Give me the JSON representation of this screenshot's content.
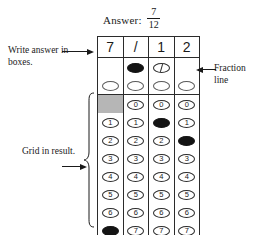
{
  "heading": {
    "answer_label": "Answer:",
    "fraction_numerator": "7",
    "fraction_denominator": "12"
  },
  "annotations": {
    "write_in_boxes": "Write answer in boxes.",
    "fraction_line": "Fraction line",
    "grid_in_result": "Grid in result."
  },
  "grid": {
    "columns": 4,
    "answer_boxes": [
      "7",
      "/",
      "1",
      "2"
    ],
    "fraction_line_row": {
      "label": "fraction-line-bubbles",
      "cells": [
        "none",
        "filled",
        "slashed",
        "none"
      ]
    },
    "decimal_point_row": {
      "label": "decimal-point-bubbles",
      "cells": [
        "empty",
        "empty",
        "empty",
        "empty"
      ]
    },
    "digit_rows": [
      {
        "digit": "0",
        "cells": [
          "shaded-blank",
          "empty",
          "empty",
          "empty"
        ]
      },
      {
        "digit": "1",
        "cells": [
          "empty",
          "empty",
          "filled",
          "empty"
        ]
      },
      {
        "digit": "2",
        "cells": [
          "empty",
          "empty",
          "empty",
          "filled"
        ]
      },
      {
        "digit": "3",
        "cells": [
          "empty",
          "empty",
          "empty",
          "empty"
        ]
      },
      {
        "digit": "4",
        "cells": [
          "empty",
          "empty",
          "empty",
          "empty"
        ]
      },
      {
        "digit": "5",
        "cells": [
          "empty",
          "empty",
          "empty",
          "empty"
        ]
      },
      {
        "digit": "6",
        "cells": [
          "empty",
          "empty",
          "empty",
          "empty"
        ]
      },
      {
        "digit": "7",
        "cells": [
          "filled",
          "empty",
          "empty",
          "empty"
        ]
      },
      {
        "digit": "8",
        "cells": [
          "empty",
          "empty",
          "empty",
          "empty"
        ]
      },
      {
        "digit": "9",
        "cells": [
          "empty",
          "empty",
          "empty",
          "empty"
        ]
      }
    ]
  },
  "colors": {
    "shaded_row": "#b6b6b6",
    "ink": "#1a1a1a",
    "grid_line": "#2b2b2b",
    "filled_bubble": "#141414",
    "page": "#ffffff"
  }
}
